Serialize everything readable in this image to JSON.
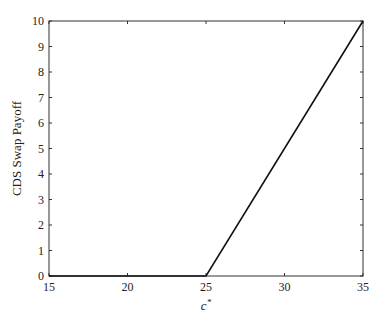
{
  "chart_data": {
    "type": "line",
    "title": "",
    "xlabel": "c*",
    "xlabel_base": "c",
    "xlabel_sup": "*",
    "ylabel": "CDS Swap Payoff",
    "xlim": [
      15,
      35
    ],
    "ylim": [
      0,
      10
    ],
    "xticks": [
      15,
      20,
      25,
      30,
      35
    ],
    "yticks": [
      0,
      1,
      2,
      3,
      4,
      5,
      6,
      7,
      8,
      9,
      10
    ],
    "grid": false,
    "legend": null,
    "series": [
      {
        "name": "CDS Swap Payoff",
        "color": "#111111",
        "x": [
          15,
          25,
          35
        ],
        "y": [
          0,
          0,
          10
        ]
      }
    ]
  },
  "layout": {
    "plot_left": 49,
    "plot_right": 363,
    "plot_top": 21,
    "plot_bottom": 276
  }
}
